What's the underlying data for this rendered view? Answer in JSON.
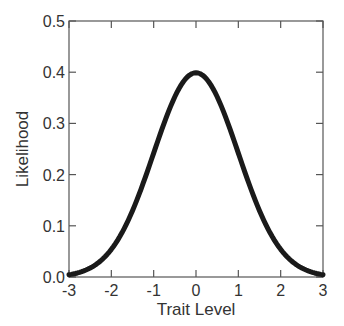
{
  "chart_data": {
    "type": "line",
    "title": "",
    "xlabel": "Trait Level",
    "ylabel": "Likelihood",
    "xlim": [
      -3,
      3
    ],
    "ylim": [
      0,
      0.5
    ],
    "xticks": [
      -3,
      -2,
      -1,
      0,
      1,
      2,
      3
    ],
    "xtick_labels": [
      "-3",
      "-2",
      "-1",
      "0",
      "1",
      "2",
      "3"
    ],
    "yticks": [
      0,
      0.1,
      0.2,
      0.3,
      0.4,
      0.5
    ],
    "ytick_labels": [
      "0.0",
      "0.1",
      "0.2",
      "0.3",
      "0.4",
      "0.5"
    ],
    "grid": false,
    "legend": null,
    "series": [
      {
        "name": "Standard normal density",
        "color": "#1a1a1a",
        "x": [
          -3,
          -2.5,
          -2,
          -1.5,
          -1,
          -0.5,
          0,
          0.5,
          1,
          1.5,
          2,
          2.5,
          3
        ],
        "values": [
          0.004,
          0.018,
          0.054,
          0.13,
          0.242,
          0.352,
          0.399,
          0.352,
          0.242,
          0.13,
          0.054,
          0.018,
          0.004
        ]
      }
    ]
  },
  "plot": {
    "left": 69,
    "top": 21,
    "right": 323,
    "bottom": 277,
    "axis_color": "#555555",
    "line_width": 5
  }
}
